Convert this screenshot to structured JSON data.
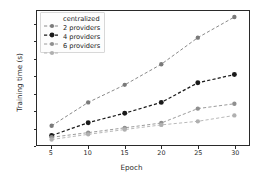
{
  "chart_data": {
    "type": "line",
    "title": "",
    "xlabel": "Epoch",
    "ylabel": "Training time (s)",
    "x": [
      5,
      10,
      15,
      20,
      25,
      30
    ],
    "xticks": [
      "5",
      "10",
      "15",
      "20",
      "25",
      "30"
    ],
    "yticks": [
      "0",
      "100",
      "200",
      "300",
      "400",
      "500",
      "600",
      "700"
    ],
    "xlim": [
      3,
      32
    ],
    "ylim": [
      0,
      780
    ],
    "grid": false,
    "legend_position": "upper left",
    "marker": "circle",
    "linestyle": "dashed",
    "series": [
      {
        "name": "centralized",
        "color": "#7a7a7a",
        "values": [
          112,
          248,
          350,
          470,
          625,
          745
        ]
      },
      {
        "name": "2 providers",
        "color": "#1a1a1a",
        "values": [
          55,
          130,
          185,
          248,
          362,
          410
        ]
      },
      {
        "name": "4 providers",
        "color": "#8f8f8f",
        "values": [
          45,
          72,
          100,
          128,
          212,
          240
        ]
      },
      {
        "name": "6 providers",
        "color": "#b0b0b0",
        "values": [
          32,
          62,
          90,
          117,
          138,
          172
        ]
      }
    ]
  },
  "figure": {
    "background": "#ffffff",
    "axis_color": "#2a2a2a"
  }
}
